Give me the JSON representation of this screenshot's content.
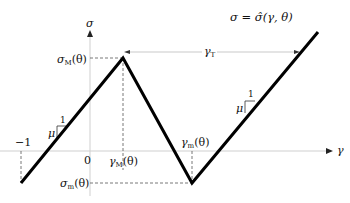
{
  "diagram": {
    "title_equation": "σ = σ̂(γ, θ)",
    "axes": {
      "x_label": "γ",
      "y_label": "σ",
      "origin_label": "0",
      "neg_one_label": "−1"
    },
    "labels": {
      "sigma_M": "σ",
      "sigma_M_sub": "M",
      "sigma_M_arg": "(θ)",
      "sigma_m": "σ",
      "sigma_m_sub": "m",
      "sigma_m_arg": "(θ)",
      "gamma_M": "γ",
      "gamma_M_sub": "M",
      "gamma_M_arg": "(θ)",
      "gamma_m": "γ",
      "gamma_m_sub": "m",
      "gamma_m_arg": "(θ)",
      "gamma_T": "γ",
      "gamma_T_sub": "T",
      "slope_left_mu": "μ",
      "slope_left_one": "1",
      "slope_right_mu": "μ",
      "slope_right_one": "1"
    },
    "curve_points": [
      [
        21,
        183
      ],
      [
        123,
        58
      ],
      [
        192,
        183
      ],
      [
        318,
        32
      ]
    ],
    "colors": {
      "curve": "#000000",
      "axis": "#cccccc",
      "dashed": "#555555"
    }
  }
}
